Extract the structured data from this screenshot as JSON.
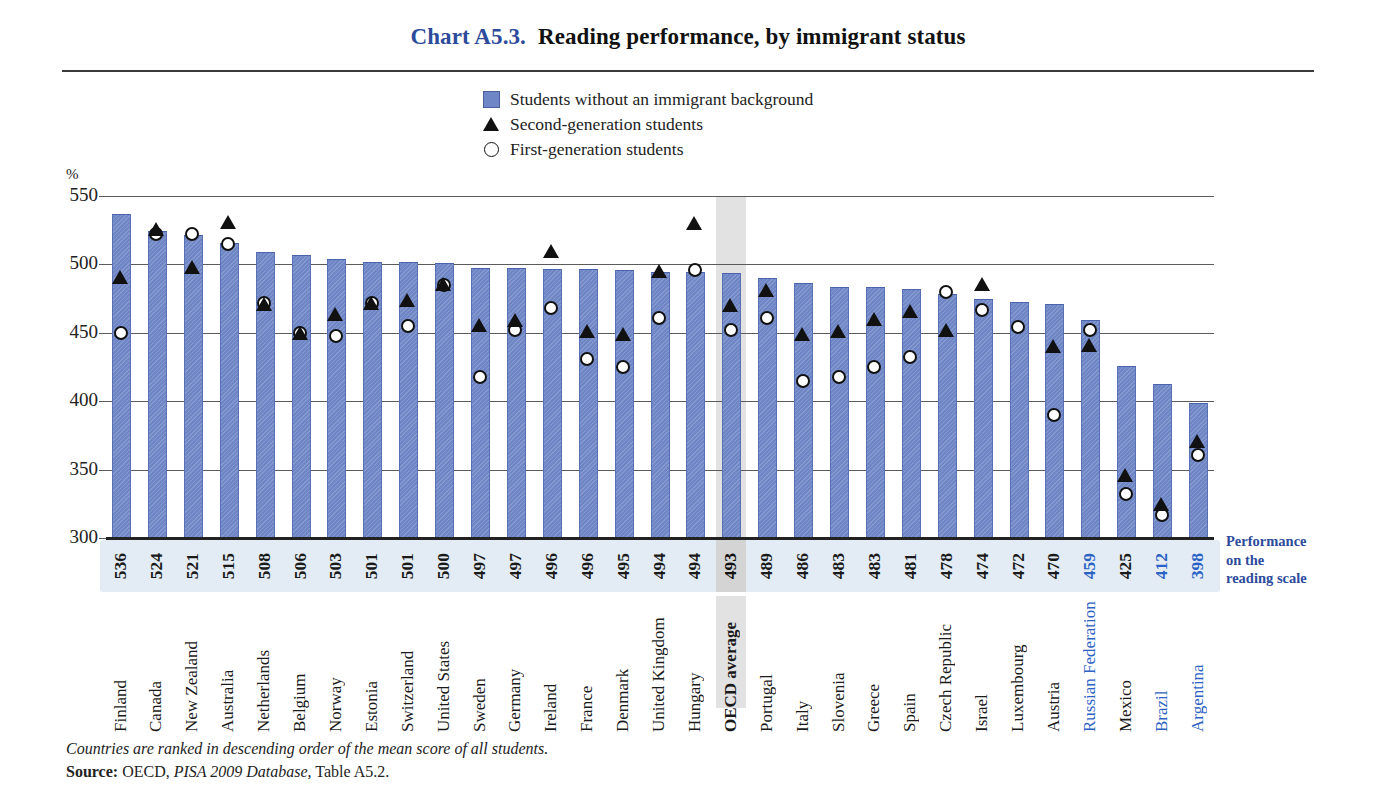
{
  "title": {
    "chart_number": "Chart A5.3.",
    "text": "Reading performance, by immigrant status"
  },
  "legend": {
    "items": [
      {
        "marker": "square-marker",
        "label": "Students without an immigrant background"
      },
      {
        "marker": "triangle-marker",
        "label": "Second-generation students"
      },
      {
        "marker": "circle-marker",
        "label": "First-generation students"
      }
    ]
  },
  "axis": {
    "y_unit": "%",
    "y_ticks": [
      "550",
      "500",
      "450",
      "400",
      "350",
      "300"
    ],
    "right_caption_lines": [
      "Performance",
      "on the",
      "reading scale"
    ]
  },
  "footnote": {
    "note": "Countries are ranked in descending order of the mean score of all students.",
    "source_label": "Source:",
    "source_pre": " OECD, ",
    "source_italic": "PISA 2009 Database,",
    "source_post": " Table A5.2."
  },
  "chart_data": {
    "type": "bar",
    "title": "Reading performance, by immigrant status",
    "xlabel": "",
    "ylabel": "Performance on the reading scale",
    "ylim": [
      300,
      550
    ],
    "yticks": [
      300,
      350,
      400,
      450,
      500,
      550
    ],
    "grid": true,
    "legend_position": "top-center",
    "annotation": "Countries are ranked in descending order of the mean score of all students.",
    "highlight_category": "OECD average",
    "categories": [
      "Finland",
      "Canada",
      "New Zealand",
      "Australia",
      "Netherlands",
      "Belgium",
      "Norway",
      "Estonia",
      "Switzerland",
      "United States",
      "Sweden",
      "Germany",
      "Ireland",
      "France",
      "Denmark",
      "United Kingdom",
      "Hungary",
      "OECD average",
      "Portugal",
      "Italy",
      "Slovenia",
      "Greece",
      "Spain",
      "Czech Republic",
      "Israel",
      "Luxembourg",
      "Austria",
      "Russian Federation",
      "Mexico",
      "Brazil",
      "Argentina"
    ],
    "category_styles": [
      "normal",
      "normal",
      "normal",
      "normal",
      "normal",
      "normal",
      "normal",
      "normal",
      "normal",
      "normal",
      "normal",
      "normal",
      "normal",
      "normal",
      "normal",
      "normal",
      "normal",
      "bold",
      "normal",
      "normal",
      "normal",
      "normal",
      "normal",
      "normal",
      "normal",
      "normal",
      "normal",
      "blue",
      "normal",
      "blue",
      "blue"
    ],
    "series": [
      {
        "name": "Students without an immigrant background",
        "marker": "bar",
        "values": [
          536,
          524,
          521,
          515,
          508,
          506,
          503,
          501,
          501,
          500,
          497,
          497,
          496,
          496,
          495,
          494,
          494,
          493,
          489,
          486,
          483,
          483,
          481,
          478,
          474,
          472,
          470,
          459,
          425,
          412,
          398
        ]
      },
      {
        "name": "Second-generation students",
        "marker": "triangle",
        "values": [
          491,
          526,
          498,
          531,
          471,
          450,
          464,
          472,
          474,
          486,
          456,
          459,
          510,
          451,
          449,
          495,
          530,
          470,
          481,
          449,
          451,
          460,
          466,
          452,
          486,
          null,
          440,
          441,
          346,
          325,
          371
        ]
      },
      {
        "name": "First-generation students",
        "marker": "circle",
        "values": [
          450,
          522,
          522,
          515,
          472,
          450,
          448,
          472,
          455,
          485,
          418,
          452,
          468,
          431,
          425,
          461,
          496,
          452,
          461,
          415,
          418,
          425,
          432,
          480,
          467,
          454,
          390,
          452,
          332,
          317,
          361
        ]
      }
    ],
    "value_labels": [
      "536",
      "524",
      "521",
      "515",
      "508",
      "506",
      "503",
      "501",
      "501",
      "500",
      "497",
      "497",
      "496",
      "496",
      "495",
      "494",
      "494",
      "493",
      "489",
      "486",
      "483",
      "483",
      "481",
      "478",
      "474",
      "472",
      "470",
      "459",
      "425",
      "412",
      "398"
    ],
    "value_label_styles": [
      "normal",
      "normal",
      "normal",
      "normal",
      "normal",
      "normal",
      "normal",
      "normal",
      "normal",
      "normal",
      "normal",
      "normal",
      "normal",
      "normal",
      "normal",
      "normal",
      "normal",
      "bold",
      "normal",
      "normal",
      "normal",
      "normal",
      "normal",
      "normal",
      "normal",
      "normal",
      "normal",
      "blue",
      "normal",
      "blue",
      "blue"
    ]
  },
  "colors": {
    "bar": "#6f86c6",
    "marker": "#111111",
    "accent_blue": "#2c4b9b",
    "label_blue": "#2c62c4",
    "value_strip": "#e3ecf5",
    "highlight_band": "#e2e2e2"
  }
}
